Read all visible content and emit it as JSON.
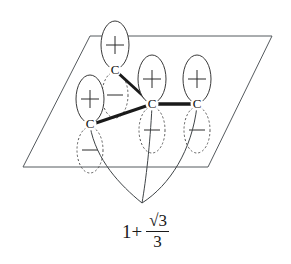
{
  "figure": {
    "kind": "molecular-orbital-diagram",
    "caption": {
      "lead": "1+",
      "numerator": "√3",
      "denominator": "3",
      "plain_text": "1 + √3/3"
    },
    "plane": {
      "stroke_color": "#555a5e",
      "corners": [
        {
          "name": "top-left",
          "x": 90,
          "y": 36
        },
        {
          "name": "top-right",
          "x": 272,
          "y": 36
        },
        {
          "name": "bottom-right",
          "x": 208,
          "y": 167
        },
        {
          "name": "bottom-left",
          "x": 23,
          "y": 167
        }
      ]
    },
    "atoms": [
      {
        "id": "c-top",
        "label": "C",
        "x": 115,
        "y": 70,
        "upper_sign": "+",
        "lower_sign": "−"
      },
      {
        "id": "c-left",
        "label": "C",
        "x": 90,
        "y": 124,
        "upper_sign": "+",
        "lower_sign": "−"
      },
      {
        "id": "c-center",
        "label": "C",
        "x": 152,
        "y": 104,
        "upper_sign": "+",
        "lower_sign": "−"
      },
      {
        "id": "c-right",
        "label": "C",
        "x": 197,
        "y": 104,
        "upper_sign": "+",
        "lower_sign": "−"
      }
    ],
    "bonds": [
      {
        "id": "bond-center-top",
        "from": "c-center",
        "to": "c-top",
        "width": 3.0
      },
      {
        "id": "bond-center-left",
        "from": "c-center",
        "to": "c-left",
        "width": 3.0
      },
      {
        "id": "bond-center-right",
        "from": "c-center",
        "to": "c-right",
        "width": 3.4
      }
    ],
    "nodal_arcs": {
      "count": 3,
      "convergence": {
        "x": 142,
        "y": 203
      },
      "stroke_color": "#3f4447",
      "from_atoms": [
        "c-left",
        "c-center",
        "c-right"
      ]
    },
    "lobes": {
      "positive_style": "solid-outline-white-fill",
      "negative_style": "dotted-outline",
      "positive_symbol": "+",
      "negative_symbol": "−",
      "rx": 14,
      "ry": 24
    },
    "colors": {
      "ink": "#1a1a1a",
      "plane_line": "#555a5e",
      "lobe_solid": "#3a3a3a",
      "lobe_dotted": "#5a5a5a",
      "background": "#ffffff"
    }
  }
}
